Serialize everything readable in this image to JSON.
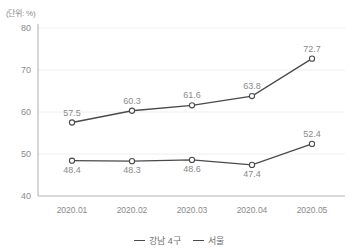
{
  "unit_label": "(단위: %)",
  "legend": {
    "position": "bottom-center",
    "items": [
      {
        "label": "강남 4구",
        "color": "#4a4a4a"
      },
      {
        "label": "서울",
        "color": "#4a4a4a"
      }
    ]
  },
  "chart_data": {
    "type": "line",
    "title": "",
    "subtitle": "",
    "xlabel": "",
    "ylabel": "",
    "unit": "(단위: %)",
    "categories": [
      "2020.01",
      "2020.02",
      "2020.03",
      "2020.04",
      "2020.05"
    ],
    "ylim": [
      40,
      80
    ],
    "yticks": [
      40,
      50,
      60,
      70,
      80
    ],
    "ytick_labels": [
      "40",
      "50",
      "60",
      "70",
      "80"
    ],
    "grid": "horizontal",
    "legend_position": "bottom-center",
    "series": [
      {
        "name": "강남 4구",
        "color": "#4a4a4a",
        "marker": "circle-open",
        "values": [
          48.4,
          48.3,
          48.6,
          47.4,
          52.4
        ],
        "labels": [
          "48.4",
          "48.3",
          "48.6",
          "47.4",
          "52.4"
        ],
        "label_positions": [
          "below",
          "below",
          "below",
          "below",
          "above"
        ]
      },
      {
        "name": "서울",
        "color": "#4a4a4a",
        "marker": "circle-open",
        "values": [
          57.5,
          60.3,
          61.6,
          63.8,
          72.7
        ],
        "labels": [
          "57.5",
          "60.3",
          "61.6",
          "63.8",
          "72.7"
        ],
        "label_positions": [
          "above",
          "above",
          "above",
          "above",
          "above"
        ]
      }
    ]
  }
}
